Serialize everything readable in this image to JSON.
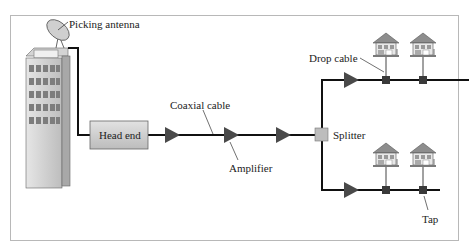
{
  "diagram": {
    "type": "cable-tv-network",
    "labels": {
      "antenna": "Picking antenna",
      "head_end": "Head end",
      "coaxial": "Coaxial cable",
      "amplifier": "Amplifier",
      "splitter": "Splitter",
      "drop_cable": "Drop cable",
      "tap": "Tap"
    },
    "colors": {
      "line": "#111111",
      "amplifier": "#4a4a4a",
      "box_fill": "#cfcfcf",
      "tap": "#3a3a3a",
      "border": "#b8b8b8"
    },
    "nodes": [
      {
        "id": "antenna",
        "kind": "dish"
      },
      {
        "id": "building",
        "kind": "building"
      },
      {
        "id": "head_end",
        "kind": "box"
      },
      {
        "id": "amp1",
        "kind": "amplifier"
      },
      {
        "id": "amp2",
        "kind": "amplifier"
      },
      {
        "id": "amp3",
        "kind": "amplifier"
      },
      {
        "id": "splitter",
        "kind": "splitter"
      },
      {
        "id": "amp_top",
        "kind": "amplifier"
      },
      {
        "id": "amp_bottom",
        "kind": "amplifier"
      },
      {
        "id": "tap_top_1",
        "kind": "tap"
      },
      {
        "id": "tap_top_2",
        "kind": "tap"
      },
      {
        "id": "tap_bottom_1",
        "kind": "tap"
      },
      {
        "id": "tap_bottom_2",
        "kind": "tap"
      },
      {
        "id": "house_top_1",
        "kind": "house"
      },
      {
        "id": "house_top_2",
        "kind": "house"
      },
      {
        "id": "house_bottom_1",
        "kind": "house"
      },
      {
        "id": "house_bottom_2",
        "kind": "house"
      }
    ]
  }
}
